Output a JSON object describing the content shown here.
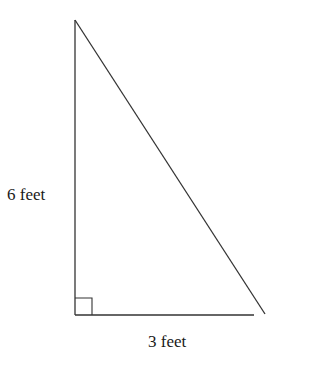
{
  "diagram": {
    "type": "right-triangle",
    "labels": {
      "vertical_side": "6 feet",
      "horizontal_side": "3 feet"
    },
    "right_angle_marker": true,
    "colors": {
      "stroke": "#333333",
      "text": "#1a1a1a",
      "background": "#ffffff"
    }
  }
}
